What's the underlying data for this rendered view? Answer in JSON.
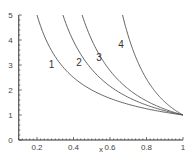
{
  "chart_data": {
    "type": "line",
    "title": "",
    "xlabel": "x",
    "ylabel": "",
    "xlim": [
      0.1,
      1
    ],
    "ylim": [
      0,
      5
    ],
    "grid": false,
    "legend": "none (inline curve labels)",
    "x_ticks": [
      "0.2",
      "0.4",
      "0.6",
      "0.8",
      "1"
    ],
    "y_ticks": [
      "0",
      "1",
      "2",
      "3",
      "4",
      "5"
    ],
    "series": [
      {
        "name": "1",
        "formula": "y = x^-1",
        "exponent": 1,
        "x": [
          0.2,
          0.3,
          0.4,
          0.5,
          0.6,
          0.8,
          1.0
        ],
        "values": [
          5.0,
          3.33,
          2.5,
          2.0,
          1.67,
          1.25,
          1.0
        ]
      },
      {
        "name": "2",
        "formula": "y = x^-1.5",
        "exponent": 1.5,
        "x": [
          0.34,
          0.4,
          0.5,
          0.6,
          0.8,
          1.0
        ],
        "values": [
          5.0,
          3.95,
          2.83,
          2.15,
          1.4,
          1.0
        ]
      },
      {
        "name": "3",
        "formula": "y = x^-2",
        "exponent": 2,
        "x": [
          0.45,
          0.5,
          0.6,
          0.7,
          0.8,
          1.0
        ],
        "values": [
          4.94,
          4.0,
          2.78,
          2.04,
          1.56,
          1.0
        ]
      },
      {
        "name": "4",
        "formula": "y = x^-4",
        "exponent": 4,
        "x": [
          0.67,
          0.7,
          0.8,
          0.9,
          1.0
        ],
        "values": [
          4.95,
          4.16,
          2.44,
          1.52,
          1.0
        ]
      }
    ],
    "annotations": [
      {
        "text": "1",
        "x": 0.28,
        "y": 3.0
      },
      {
        "text": "2",
        "x": 0.43,
        "y": 3.1
      },
      {
        "text": "3",
        "x": 0.54,
        "y": 3.3
      },
      {
        "text": "4",
        "x": 0.66,
        "y": 3.8
      }
    ]
  }
}
